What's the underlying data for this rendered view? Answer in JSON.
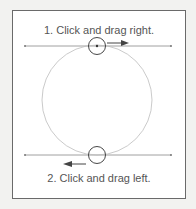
{
  "diagram": {
    "step1": "1. Click and drag right.",
    "step2": "2. Click and drag left.",
    "colors": {
      "line": "#777777",
      "circle": "#bbbbbb",
      "handle": "#333333",
      "arrow": "#444444"
    }
  }
}
